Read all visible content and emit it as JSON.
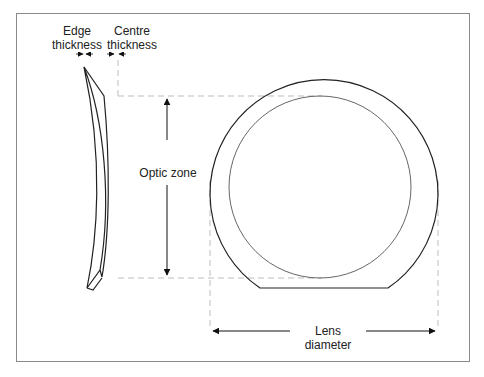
{
  "diagram": {
    "title": "",
    "labels": {
      "edge_thickness_line1": "Edge",
      "edge_thickness_line2": "thickness",
      "centre_thickness_line1": "Centre",
      "centre_thickness_line2": "thickness",
      "optic_zone": "Optic zone",
      "lens_diameter": "Lens diameter"
    },
    "colors": {
      "stroke": "#222222",
      "dashed": "#bdbdbd",
      "frame": "#8a8a8a"
    },
    "components": [
      "lens-cross-section",
      "lens-front-view-outer-truncated-circle",
      "optic-zone-inner-circle",
      "optic-zone-dimension-arrow",
      "lens-diameter-dimension-arrow",
      "edge-thickness-marker",
      "centre-thickness-marker"
    ]
  }
}
